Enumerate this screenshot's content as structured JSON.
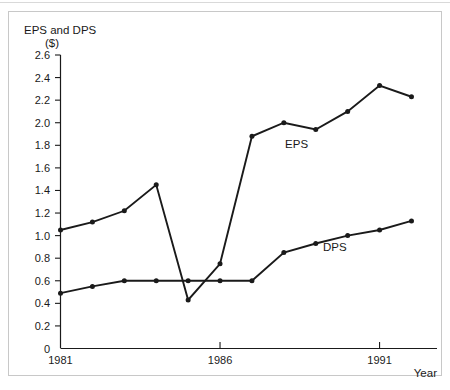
{
  "chart_data": {
    "type": "line",
    "title": "",
    "ylabel": "EPS and DPS\n($)",
    "ylabel_line1": "EPS and DPS",
    "ylabel_line2": "($)",
    "xlabel": "Year",
    "ylim": [
      0,
      2.6
    ],
    "xlim": [
      1981,
      1992.8
    ],
    "grid": false,
    "legend_position": "inline-annotation",
    "ytick_labels": [
      "0",
      "0.2",
      "0.4",
      "0.6",
      "0.8",
      "1.0",
      "1.2",
      "1.4",
      "1.6",
      "1.8",
      "2.0",
      "2.2",
      "2.4",
      "2.6"
    ],
    "ytick_values": [
      0,
      0.2,
      0.4,
      0.6,
      0.8,
      1.0,
      1.2,
      1.4,
      1.6,
      1.8,
      2.0,
      2.2,
      2.4,
      2.6
    ],
    "xtick_values": [
      1981,
      1982,
      1983,
      1984,
      1985,
      1986,
      1987,
      1988,
      1989,
      1990,
      1991,
      1992
    ],
    "xtick_labels_shown": [
      "1981",
      "1986",
      "1991"
    ],
    "xtick_label_values": [
      1981,
      1986,
      1991
    ],
    "x": [
      1981,
      1982,
      1983,
      1984,
      1985,
      1986,
      1987,
      1988,
      1989,
      1990,
      1991,
      1992
    ],
    "series": [
      {
        "name": "EPS",
        "color": "#1a1a1a",
        "label_x": 1988.4,
        "label_y": 1.78,
        "values": [
          1.05,
          1.12,
          1.22,
          1.45,
          0.43,
          0.75,
          1.88,
          2.0,
          1.94,
          2.1,
          2.33,
          2.23
        ]
      },
      {
        "name": "DPS",
        "color": "#1a1a1a",
        "label_x": 1989.6,
        "label_y": 0.86,
        "values": [
          0.49,
          0.55,
          0.6,
          0.6,
          0.6,
          0.6,
          0.6,
          0.85,
          0.93,
          1.0,
          1.05,
          1.13
        ]
      }
    ]
  }
}
